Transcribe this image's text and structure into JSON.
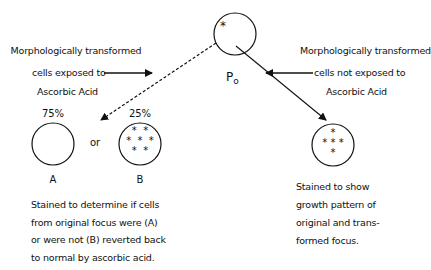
{
  "top_node": {
    "label": "P",
    "subscript": "o",
    "marker": "*"
  },
  "left_branch": {
    "annotation": [
      "Morphologically transformed",
      "cells exposed to",
      "Ascorbic Acid"
    ],
    "arrow_style": "dashed",
    "outcomes": [
      {
        "percent": "75%",
        "label": "A",
        "asterisks": 0
      },
      {
        "percent": "25%",
        "label": "B",
        "asterisks": 7
      }
    ],
    "connector": "or",
    "caption": [
      "Stained to determine if cells",
      "from original focus were (A)",
      "or were not (B) reverted back",
      "to normal by ascorbic acid."
    ]
  },
  "right_branch": {
    "annotation": [
      "Morphologically transformed",
      "cells not exposed to",
      "Ascorbic Acid"
    ],
    "arrow_style": "solid",
    "asterisks": 5,
    "caption": [
      "Stained to show",
      "growth pattern of",
      "original and trans-",
      "formed focus."
    ]
  }
}
